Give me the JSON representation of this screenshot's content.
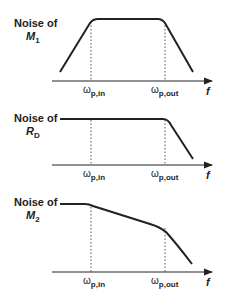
{
  "plots": [
    {
      "title": "Noise of",
      "variable": "M",
      "subscript": "1",
      "x_axis_label": "f",
      "ticks": [
        {
          "symbol": "ω",
          "sub": "p,in"
        },
        {
          "symbol": "ω",
          "sub": "p,out"
        }
      ],
      "shape": "band-pass"
    },
    {
      "title": "Noise of",
      "variable": "R",
      "subscript": "D",
      "x_axis_label": "f",
      "ticks": [
        {
          "symbol": "ω",
          "sub": "p,in"
        },
        {
          "symbol": "ω",
          "sub": "p,out"
        }
      ],
      "shape": "low-pass"
    },
    {
      "title": "Noise of",
      "variable": "M",
      "subscript": "2",
      "x_axis_label": "f",
      "ticks": [
        {
          "symbol": "ω",
          "sub": "p,in"
        },
        {
          "symbol": "ω",
          "sub": "p,out"
        }
      ],
      "shape": "two-pole roll-off"
    }
  ],
  "colors": {
    "curve": "#222222",
    "axis": "#222222",
    "dashed": "#555555"
  }
}
